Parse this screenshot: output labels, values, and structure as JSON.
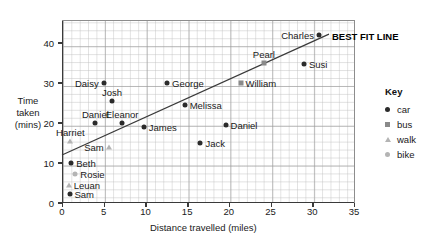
{
  "chart_data": {
    "type": "scatter",
    "title": "",
    "xlabel": "Distance travelled (miles)",
    "ylabel": "Time taken (mins)",
    "xlim": [
      0,
      35
    ],
    "ylim": [
      0,
      45
    ],
    "xticks": [
      0,
      5,
      10,
      15,
      20,
      25,
      30,
      35
    ],
    "yticks": [
      0,
      10,
      20,
      30,
      40
    ],
    "grid": true,
    "legend_position": "right",
    "series": [
      {
        "name": "car",
        "marker": "circle",
        "color": "#2b2b2b"
      },
      {
        "name": "bus",
        "marker": "square",
        "color": "#8a8a8a"
      },
      {
        "name": "walk",
        "marker": "triangle",
        "color": "#b4b4b4"
      },
      {
        "name": "bike",
        "marker": "circle",
        "color": "#b4b4b4"
      }
    ],
    "points": [
      {
        "label": "Daisy",
        "x": 5.0,
        "y": 30.0,
        "mode": "car",
        "side": "left"
      },
      {
        "label": "Josh",
        "x": 6.0,
        "y": 25.5,
        "mode": "car",
        "side": "above"
      },
      {
        "label": "Daniel",
        "x": 4.0,
        "y": 20.0,
        "mode": "car",
        "side": "above"
      },
      {
        "label": "Eleanor",
        "x": 7.2,
        "y": 20.0,
        "mode": "car",
        "side": "above"
      },
      {
        "label": "James",
        "x": 9.8,
        "y": 19.0,
        "mode": "car",
        "side": "right"
      },
      {
        "label": "Harriet",
        "x": 1.0,
        "y": 15.5,
        "mode": "walk",
        "side": "above"
      },
      {
        "label": "Sam",
        "x": 5.6,
        "y": 14.0,
        "mode": "walk",
        "side": "left"
      },
      {
        "label": "Beth",
        "x": 1.1,
        "y": 10.0,
        "mode": "car",
        "side": "right"
      },
      {
        "label": "Rosie",
        "x": 1.6,
        "y": 7.3,
        "mode": "bike",
        "side": "right"
      },
      {
        "label": "Leuan",
        "x": 0.8,
        "y": 4.5,
        "mode": "walk",
        "side": "right"
      },
      {
        "label": "Sam",
        "x": 0.9,
        "y": 2.3,
        "mode": "car",
        "side": "right"
      },
      {
        "label": "George",
        "x": 12.6,
        "y": 30.0,
        "mode": "car",
        "side": "right"
      },
      {
        "label": "Melissa",
        "x": 14.7,
        "y": 24.5,
        "mode": "car",
        "side": "right"
      },
      {
        "label": "Jack",
        "x": 16.6,
        "y": 15.0,
        "mode": "car",
        "side": "right"
      },
      {
        "label": "Daniel",
        "x": 19.6,
        "y": 19.5,
        "mode": "car",
        "side": "right"
      },
      {
        "label": "William",
        "x": 21.4,
        "y": 30.0,
        "mode": "bus",
        "side": "right"
      },
      {
        "label": "Pearl",
        "x": 24.2,
        "y": 35.0,
        "mode": "bus",
        "side": "above"
      },
      {
        "label": "Susi",
        "x": 29.0,
        "y": 34.8,
        "mode": "car",
        "side": "right"
      },
      {
        "label": "Charles",
        "x": 30.8,
        "y": 42.0,
        "mode": "car",
        "side": "left"
      }
    ],
    "best_fit_line": {
      "label": "BEST FIT LINE",
      "from": {
        "x": 0.0,
        "y": 12.0
      },
      "to": {
        "x": 32.0,
        "y": 42.2
      }
    }
  },
  "key": {
    "title": "Key",
    "items": [
      {
        "label": "car",
        "marker": "circle-dark"
      },
      {
        "label": "bus",
        "marker": "square-gray"
      },
      {
        "label": "walk",
        "marker": "triangle-gray"
      },
      {
        "label": "bike",
        "marker": "circle-gray"
      }
    ]
  },
  "axes": {
    "x_title": "Distance travelled (miles)",
    "y_title_line1": "Time",
    "y_title_line2": "taken",
    "y_title_line3": "(mins)"
  }
}
